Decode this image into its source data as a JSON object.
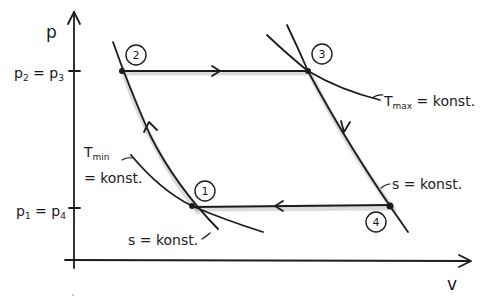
{
  "diagram": {
    "title": "",
    "type": "p-v diagram (thermodynamic cycle)",
    "axes": {
      "y_label": "p",
      "x_label": "v"
    },
    "tick_labels": {
      "upper": {
        "left": "p",
        "left_sub": "2",
        "eq": " = ",
        "right": "p",
        "right_sub": "3"
      },
      "lower": {
        "left": "p",
        "left_sub": "1",
        "eq": " = ",
        "right": "p",
        "right_sub": "4"
      }
    },
    "states": [
      {
        "id": "1",
        "label": "1",
        "x": 192,
        "y": 206
      },
      {
        "id": "2",
        "label": "2",
        "x": 122,
        "y": 71
      },
      {
        "id": "3",
        "label": "3",
        "x": 308,
        "y": 71
      },
      {
        "id": "4",
        "label": "4",
        "x": 390,
        "y": 206
      }
    ],
    "processes": [
      {
        "from": "1",
        "to": "2",
        "type": "isentropic compression"
      },
      {
        "from": "2",
        "to": "3",
        "type": "isobaric heat addition"
      },
      {
        "from": "3",
        "to": "4",
        "type": "isentropic expansion"
      },
      {
        "from": "4",
        "to": "1",
        "type": "isobaric heat rejection"
      }
    ],
    "annotations": {
      "t_max": {
        "T": "T",
        "sub": "max",
        "rest": " = konst."
      },
      "t_min_line1": {
        "T": "T",
        "sub": "min"
      },
      "t_min_line2": "= konst.",
      "s_right": "s = konst.",
      "s_left": "s = konst."
    }
  }
}
